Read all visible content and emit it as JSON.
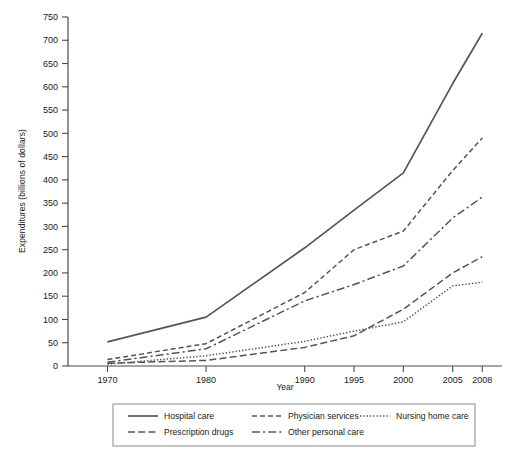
{
  "chart_data": {
    "type": "line",
    "title": "",
    "xlabel": "Year",
    "ylabel": "Expenditures (billions of dollars)",
    "x": [
      1970,
      1980,
      1990,
      1995,
      2000,
      2005,
      2008
    ],
    "xtick_labels": [
      "1970",
      "1980",
      "1990",
      "1995",
      "2000",
      "2005",
      "2008"
    ],
    "xlim": [
      1966,
      2010
    ],
    "ylim": [
      0,
      750
    ],
    "ytick_labels": [
      "0",
      "50",
      "100",
      "150",
      "200",
      "250",
      "300",
      "350",
      "400",
      "450",
      "500",
      "550",
      "600",
      "650",
      "700",
      "750"
    ],
    "ytick_values": [
      0,
      50,
      100,
      150,
      200,
      250,
      300,
      350,
      400,
      450,
      500,
      550,
      600,
      650,
      700,
      750
    ],
    "grid": false,
    "legend_position": "below-axes",
    "series": [
      {
        "name": "Hospital care",
        "style": "solid",
        "color": "#555555",
        "values": [
          52,
          105,
          254,
          335,
          415,
          607,
          715
        ]
      },
      {
        "name": "Physician services",
        "style": "dashed",
        "color": "#555555",
        "values": [
          14,
          48,
          158,
          250,
          290,
          420,
          490
        ]
      },
      {
        "name": "Nursing home care",
        "style": "dotted",
        "color": "#555555",
        "values": [
          4,
          22,
          53,
          75,
          95,
          172,
          180
        ]
      },
      {
        "name": "Prescription drugs",
        "style": "dash-dot-long",
        "color": "#555555",
        "values": [
          6,
          12,
          40,
          65,
          122,
          200,
          235
        ]
      },
      {
        "name": "Other personal care",
        "style": "dash-dot",
        "color": "#555555",
        "values": [
          8,
          37,
          140,
          175,
          215,
          318,
          363
        ]
      }
    ]
  },
  "legend": {
    "entries": [
      {
        "label": "Hospital care",
        "style": "solid"
      },
      {
        "label": "Physician services",
        "style": "dashed"
      },
      {
        "label": "Nursing home care",
        "style": "dotted"
      },
      {
        "label": "Prescription drugs",
        "style": "dash-dot-long"
      },
      {
        "label": "Other personal care",
        "style": "dash-dot"
      }
    ]
  }
}
